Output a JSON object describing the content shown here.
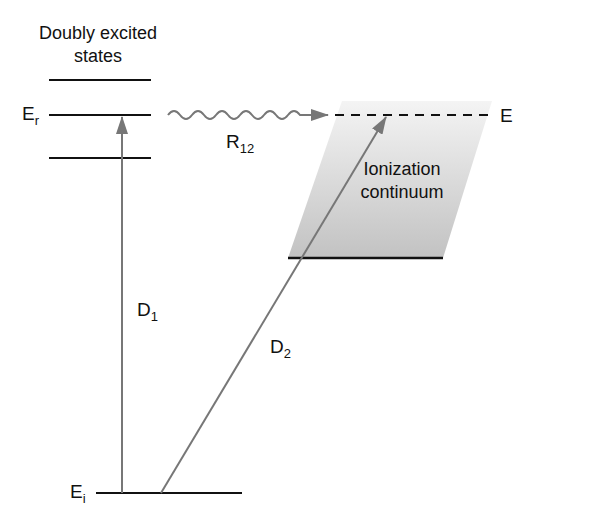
{
  "diagram": {
    "title_lines": [
      "Doubly excited",
      "states"
    ],
    "labels": {
      "Er": {
        "main": "E",
        "sub": "r"
      },
      "Ei": {
        "main": "E",
        "sub": "i"
      },
      "E": {
        "main": "E"
      },
      "R12": {
        "main": "R",
        "sub": "12"
      },
      "D1": {
        "main": "D",
        "sub": "1"
      },
      "D2": {
        "main": "D",
        "sub": "2"
      },
      "continuum": [
        "Ionization",
        "continuum"
      ]
    },
    "colors": {
      "level_line": "#111111",
      "arrow": "#777777",
      "continuum_fill_top": "#f3f3f3",
      "continuum_fill_bottom": "#c4c4c4"
    }
  }
}
